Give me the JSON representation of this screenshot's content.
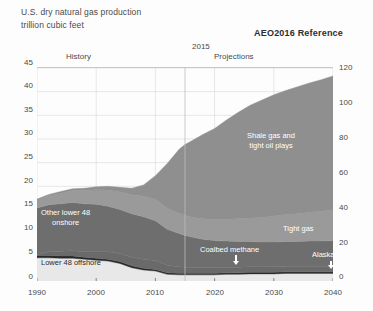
{
  "header": {
    "title_line1": "U.S. dry natural gas production",
    "title_line2": "trillion cubic feet",
    "scenario": "AEO2016 Reference"
  },
  "annotations": {
    "history": "History",
    "split_year": "2015",
    "projections": "Projections",
    "coalbed_arrow_icon": "arrow-down-icon",
    "alaska_arrow_icon": "arrow-down-icon"
  },
  "colors": {
    "shale": "#8f8f8f",
    "tight_gas": "#9a9a9a",
    "coalbed": "#6a6a6a",
    "alaska": "#2a2a2a",
    "onshore": "#6e6e6e",
    "offshore": "#e8e8e8",
    "axis": "#6b6b6b",
    "grid": "#d8d8d8",
    "text": "#4a4a4a"
  },
  "chart_data": {
    "type": "area",
    "title": "U.S. dry natural gas production",
    "subtitle": "trillion cubic feet",
    "xlabel": "",
    "ylabel": "trillion cubic feet",
    "ylabel_right": "",
    "xlim": [
      1990,
      2040
    ],
    "ylim": [
      0,
      45
    ],
    "ylim_right": [
      0,
      120
    ],
    "grid": true,
    "legend_position": "inline-labels",
    "x_ticks": [
      "1990",
      "2000",
      "2010",
      "2020",
      "2030",
      "2040"
    ],
    "y_ticks_left": [
      "0",
      "5",
      "10",
      "15",
      "20",
      "25",
      "30",
      "35",
      "40",
      "45"
    ],
    "y_ticks_right": [
      "0",
      "20",
      "40",
      "60",
      "80",
      "100",
      "120"
    ],
    "history_projection_split": 2015,
    "x": [
      1990,
      1992,
      1994,
      1996,
      1998,
      2000,
      2002,
      2004,
      2006,
      2008,
      2010,
      2012,
      2014,
      2015,
      2016,
      2018,
      2020,
      2022,
      2024,
      2026,
      2028,
      2030,
      2032,
      2034,
      2036,
      2038,
      2040
    ],
    "series": [
      {
        "name": "Lower 48 offshore",
        "label": "Lower 48 offshore",
        "color": "#e8e8e8",
        "values": [
          4.9,
          4.9,
          4.8,
          4.8,
          4.6,
          4.4,
          4.2,
          3.7,
          2.8,
          2.3,
          2.1,
          1.4,
          1.3,
          1.3,
          1.3,
          1.3,
          1.3,
          1.4,
          1.4,
          1.5,
          1.5,
          1.5,
          1.6,
          1.6,
          1.6,
          1.6,
          1.6
        ]
      },
      {
        "name": "Alaska",
        "label": "Alaska",
        "color": "#2a2a2a",
        "values": [
          0.5,
          0.5,
          0.5,
          0.5,
          0.4,
          0.4,
          0.4,
          0.4,
          0.4,
          0.4,
          0.35,
          0.35,
          0.33,
          0.33,
          0.33,
          0.33,
          0.33,
          0.33,
          0.33,
          0.33,
          0.33,
          0.33,
          0.33,
          0.33,
          0.33,
          0.33,
          0.33
        ]
      },
      {
        "name": "Coalbed methane",
        "label": "Coalbed methane",
        "color": "#6a6a6a",
        "values": [
          0.2,
          0.8,
          1.0,
          1.1,
          1.2,
          1.4,
          1.6,
          1.7,
          1.8,
          1.9,
          1.9,
          1.6,
          1.4,
          1.3,
          1.3,
          1.2,
          1.2,
          1.2,
          1.2,
          1.2,
          1.2,
          1.2,
          1.2,
          1.2,
          1.2,
          1.2,
          1.2
        ]
      },
      {
        "name": "Other lower 48 onshore",
        "label": "Other lower 48 onshore",
        "color": "#6e6e6e",
        "values": [
          9.8,
          9.9,
          10.0,
          10.2,
          10.1,
          10.0,
          9.6,
          9.3,
          9.2,
          9.0,
          8.4,
          7.6,
          7.0,
          6.7,
          6.4,
          6.0,
          5.7,
          5.5,
          5.4,
          5.3,
          5.2,
          5.2,
          5.2,
          5.2,
          5.3,
          5.3,
          5.4
        ]
      },
      {
        "name": "Tight gas",
        "label": "Tight gas",
        "color": "#9a9a9a",
        "values": [
          1.6,
          1.9,
          2.2,
          2.5,
          2.8,
          3.1,
          3.4,
          3.7,
          4.0,
          4.3,
          4.5,
          4.4,
          4.3,
          4.2,
          4.2,
          4.3,
          4.4,
          4.6,
          4.8,
          5.0,
          5.2,
          5.5,
          5.7,
          5.9,
          6.1,
          6.3,
          6.5
        ]
      },
      {
        "name": "Shale gas and tight oil plays",
        "label": "Shale gas and tight oil plays",
        "color": "#8f8f8f",
        "values": [
          0.3,
          0.3,
          0.4,
          0.4,
          0.5,
          0.6,
          0.8,
          1.0,
          1.4,
          2.4,
          5.0,
          9.5,
          13.5,
          15.0,
          16.0,
          17.8,
          19.3,
          21.0,
          22.5,
          23.8,
          24.8,
          25.6,
          26.2,
          26.8,
          27.3,
          27.8,
          28.3
        ]
      }
    ],
    "totals_note": "Total dry gas production rises from about 17.5 tcf in 1990 to about 43 tcf in 2040"
  }
}
